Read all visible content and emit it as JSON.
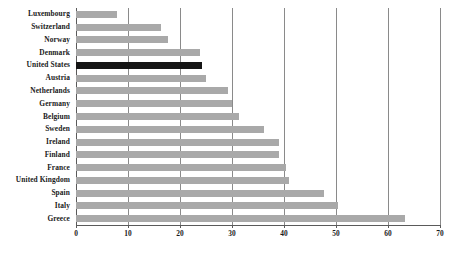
{
  "chart_data": {
    "type": "bar",
    "orientation": "horizontal",
    "title": "",
    "subtitle": "",
    "xlabel": "",
    "ylabel": "",
    "xlim": [
      0,
      70
    ],
    "xticks": [
      0,
      10,
      20,
      30,
      40,
      50,
      60,
      70
    ],
    "xtick_labels": [
      "0",
      "10",
      "20",
      "30",
      "40",
      "50",
      "60",
      "70"
    ],
    "grid": "vertical",
    "legend": "none",
    "categories": [
      "Luxembourg",
      "Switzerland",
      "Norway",
      "Denmark",
      "United States",
      "Austria",
      "Netherlands",
      "Germany",
      "Belgium",
      "Sweden",
      "Ireland",
      "Finland",
      "France",
      "United Kingdom",
      "Spain",
      "Italy",
      "Greece"
    ],
    "values": [
      7.8,
      16.3,
      17.6,
      23.8,
      24.2,
      25.0,
      29.2,
      30.0,
      31.3,
      36.2,
      39.0,
      39.0,
      40.4,
      41.0,
      47.7,
      50.4,
      63.3
    ],
    "highlight_category": "United States",
    "colors": {
      "bar": "#a9a9a9",
      "bar_highlight": "#151515",
      "gridline": "#8a8a8a",
      "axis": "#5a5a5a",
      "text": "#1a1a1a",
      "background": "#ffffff"
    }
  }
}
